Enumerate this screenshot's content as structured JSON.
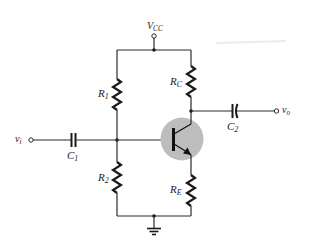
{
  "diagram": {
    "type": "circuit-schematic",
    "colors": {
      "wire": "#2a2a2a",
      "transistor_highlight": "#bdbdbd",
      "background": "#ffffff"
    },
    "labels": {
      "vcc": {
        "main": "V",
        "sub": "CC"
      },
      "r1": {
        "main": "R",
        "sub": "1"
      },
      "r2": {
        "main": "R",
        "sub": "2"
      },
      "rc": {
        "main": "R",
        "sub": "C"
      },
      "re": {
        "main": "R",
        "sub": "E"
      },
      "c1": {
        "main": "C",
        "sub": "1"
      },
      "c2": {
        "main": "C",
        "sub": "2"
      },
      "vi": {
        "main": "v",
        "sub": "i"
      },
      "vo": {
        "main": "v",
        "sub": "o"
      }
    },
    "components": [
      {
        "id": "R1",
        "kind": "resistor",
        "between": [
          "VCC rail",
          "base node"
        ]
      },
      {
        "id": "R2",
        "kind": "resistor",
        "between": [
          "base node",
          "ground"
        ]
      },
      {
        "id": "RC",
        "kind": "resistor",
        "between": [
          "VCC rail",
          "collector"
        ]
      },
      {
        "id": "RE",
        "kind": "resistor",
        "between": [
          "emitter",
          "ground"
        ]
      },
      {
        "id": "C1",
        "kind": "capacitor",
        "between": [
          "vi",
          "base node"
        ]
      },
      {
        "id": "C2",
        "kind": "capacitor",
        "between": [
          "collector",
          "vo"
        ]
      },
      {
        "id": "Q1",
        "kind": "npn-transistor",
        "highlighted": true
      }
    ]
  }
}
